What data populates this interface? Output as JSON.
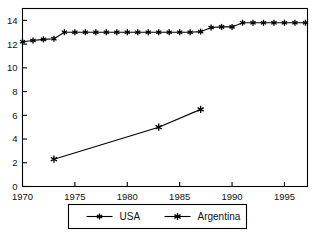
{
  "chart_data": {
    "type": "line",
    "title": "",
    "subtitle": "",
    "xlabel": "",
    "ylabel": "",
    "xlim": [
      1970,
      1997.2
    ],
    "ylim": [
      0,
      15
    ],
    "grid": false,
    "legend_position": "bottom",
    "xticks": [
      1970,
      1975,
      1980,
      1985,
      1990,
      1995
    ],
    "xtick_labels": [
      "1970",
      "1975",
      "1980",
      "1985",
      "1990",
      "1995"
    ],
    "yticks": [
      0,
      2,
      4,
      6,
      8,
      10,
      12,
      14
    ],
    "ytick_labels": [
      "0",
      "2",
      "4",
      "6",
      "8",
      "10",
      "12",
      "14"
    ],
    "series": [
      {
        "name": "USA",
        "marker": "asterisk",
        "color": "#000000",
        "x": [
          1970,
          1971,
          1972,
          1973,
          1974,
          1975,
          1976,
          1977,
          1978,
          1979,
          1980,
          1981,
          1982,
          1983,
          1984,
          1985,
          1986,
          1987,
          1988,
          1989,
          1990,
          1991,
          1992,
          1993,
          1994,
          1995,
          1996,
          1997
        ],
        "values": [
          12.2,
          12.3,
          12.4,
          12.45,
          13.0,
          13.0,
          13.0,
          13.0,
          13.0,
          13.0,
          13.0,
          13.0,
          13.0,
          13.0,
          13.0,
          13.0,
          13.0,
          13.05,
          13.4,
          13.45,
          13.45,
          13.8,
          13.8,
          13.8,
          13.8,
          13.8,
          13.8,
          13.8
        ]
      },
      {
        "name": "Argentina",
        "marker": "asterisk",
        "color": "#000000",
        "x": [
          1973,
          1983,
          1987
        ],
        "values": [
          2.3,
          5.0,
          6.5
        ]
      }
    ]
  },
  "legend": {
    "entries": [
      {
        "label": "USA"
      },
      {
        "label": "Argentina"
      }
    ]
  }
}
